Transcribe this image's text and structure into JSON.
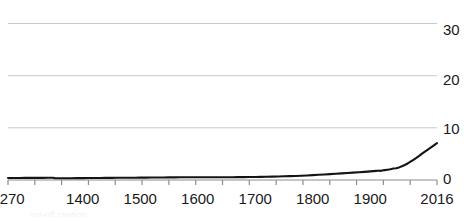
{
  "chart_data": {
    "type": "line",
    "title": "",
    "subtitle": "",
    "xlabel": "",
    "ylabel": "",
    "xlim": [
      1270,
      2016
    ],
    "ylim": [
      0,
      31.5
    ],
    "grid": true,
    "legend": null,
    "line_color": "#141414",
    "grid_color": "#c8c8c8",
    "axis_color": "#8c8c8c",
    "y_ticks": [
      0,
      10,
      20,
      30
    ],
    "y_tick_labels": [
      "0",
      "10",
      "20",
      "30"
    ],
    "x_ticks": [
      1270,
      1400,
      1500,
      1600,
      1700,
      1800,
      1900,
      2016
    ],
    "x_tick_labels": [
      "1270",
      "1400",
      "1500",
      "1600",
      "1700",
      "1800",
      "1900",
      "2016"
    ],
    "x_minor_tick_count": 16,
    "series": [
      {
        "name": "value",
        "x": [
          1270,
          1280,
          1290,
          1300,
          1310,
          1320,
          1330,
          1340,
          1348,
          1352,
          1360,
          1370,
          1380,
          1390,
          1400,
          1410,
          1420,
          1430,
          1440,
          1450,
          1460,
          1470,
          1480,
          1490,
          1500,
          1510,
          1520,
          1530,
          1540,
          1550,
          1560,
          1570,
          1580,
          1590,
          1600,
          1610,
          1620,
          1630,
          1640,
          1650,
          1660,
          1670,
          1680,
          1690,
          1700,
          1710,
          1720,
          1730,
          1740,
          1750,
          1760,
          1770,
          1780,
          1790,
          1800,
          1810,
          1820,
          1830,
          1840,
          1850,
          1860,
          1870,
          1880,
          1890,
          1900,
          1905,
          1910,
          1913,
          1916,
          1918,
          1920,
          1925,
          1930,
          1935,
          1940,
          1945,
          1950,
          1955,
          1960,
          1965,
          1970,
          1975,
          1980,
          1985,
          1990,
          1995,
          2000,
          2005,
          2010,
          2013,
          2014,
          2015,
          2016
        ],
        "y": [
          0.39,
          0.4,
          0.41,
          0.42,
          0.42,
          0.43,
          0.43,
          0.44,
          0.44,
          0.36,
          0.35,
          0.36,
          0.36,
          0.37,
          0.38,
          0.39,
          0.4,
          0.41,
          0.42,
          0.43,
          0.44,
          0.45,
          0.46,
          0.46,
          0.47,
          0.48,
          0.49,
          0.5,
          0.51,
          0.52,
          0.53,
          0.54,
          0.55,
          0.55,
          0.56,
          0.56,
          0.55,
          0.55,
          0.54,
          0.55,
          0.56,
          0.57,
          0.58,
          0.59,
          0.6,
          0.62,
          0.64,
          0.67,
          0.7,
          0.74,
          0.78,
          0.82,
          0.87,
          0.92,
          0.99,
          1.05,
          1.12,
          1.19,
          1.26,
          1.33,
          1.4,
          1.48,
          1.56,
          1.64,
          1.73,
          1.78,
          1.83,
          1.86,
          1.88,
          1.83,
          1.9,
          1.98,
          2.07,
          2.17,
          2.3,
          2.36,
          2.54,
          2.77,
          3.03,
          3.33,
          3.7,
          4.07,
          4.45,
          4.85,
          5.3,
          5.72,
          6.12,
          6.5,
          6.92,
          7.18,
          7.26,
          7.35,
          7.44
        ]
      }
    ]
  },
  "artifact": {
    "faint_text": "cut-off caption"
  }
}
